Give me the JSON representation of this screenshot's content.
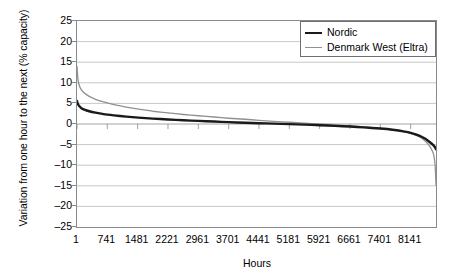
{
  "chart_data": {
    "type": "line",
    "title": "",
    "xlabel": "Hours",
    "ylabel": "Variation from one hour to the next (% capacity)",
    "xlim": [
      1,
      8760
    ],
    "ylim": [
      -25,
      25
    ],
    "grid": true,
    "legend_position": "top-right",
    "xticks": [
      1,
      741,
      1481,
      2221,
      2961,
      3701,
      4441,
      5181,
      5921,
      6661,
      7401,
      8141
    ],
    "xticklabels": [
      "1",
      "741",
      "1481",
      "2221",
      "2961",
      "3701",
      "4441",
      "5181",
      "5921",
      "6661",
      "7401",
      "8141"
    ],
    "yticks": [
      25,
      20,
      15,
      10,
      5,
      0,
      -5,
      -10,
      -15,
      -20,
      -25
    ],
    "yticklabels": [
      "25",
      "20",
      "15",
      "10",
      "5",
      "0",
      "–5",
      "–10",
      "–15",
      "–20",
      "–25"
    ],
    "x": [
      1,
      20,
      50,
      100,
      180,
      300,
      450,
      650,
      900,
      1200,
      1500,
      1850,
      2221,
      2600,
      2961,
      3350,
      3701,
      4100,
      4441,
      4800,
      5181,
      5550,
      5921,
      6300,
      6661,
      7000,
      7401,
      7700,
      8000,
      8141,
      8350,
      8500,
      8620,
      8700,
      8740,
      8760
    ],
    "series": [
      {
        "name": "Nordic",
        "color": "#1a1a1a",
        "width": 2.4,
        "values": [
          5.6,
          4.9,
          4.4,
          3.9,
          3.5,
          3.1,
          2.75,
          2.4,
          2.1,
          1.8,
          1.55,
          1.3,
          1.1,
          0.9,
          0.75,
          0.6,
          0.45,
          0.3,
          0.2,
          0.08,
          -0.03,
          -0.15,
          -0.3,
          -0.45,
          -0.62,
          -0.82,
          -1.1,
          -1.4,
          -1.85,
          -2.15,
          -2.8,
          -3.6,
          -4.5,
          -5.2,
          -5.7,
          -6.1
        ]
      },
      {
        "name": "Denmark West (Eltra)",
        "color": "#909090",
        "width": 1.3,
        "values": [
          14.0,
          11.2,
          9.6,
          8.4,
          7.5,
          6.7,
          6.0,
          5.35,
          4.7,
          4.1,
          3.6,
          3.1,
          2.7,
          2.3,
          2.0,
          1.7,
          1.4,
          1.15,
          0.9,
          0.65,
          0.42,
          0.2,
          0.0,
          -0.2,
          -0.45,
          -0.7,
          -1.05,
          -1.4,
          -1.9,
          -2.3,
          -3.1,
          -4.2,
          -5.6,
          -7.3,
          -10.2,
          -14.8
        ]
      }
    ]
  },
  "legend": {
    "items": [
      {
        "label": "Nordic"
      },
      {
        "label": "Denmark West (Eltra)"
      }
    ]
  },
  "axes": {
    "x_title": "Hours",
    "y_title": "Variation from one hour to the next (% capacity)"
  }
}
